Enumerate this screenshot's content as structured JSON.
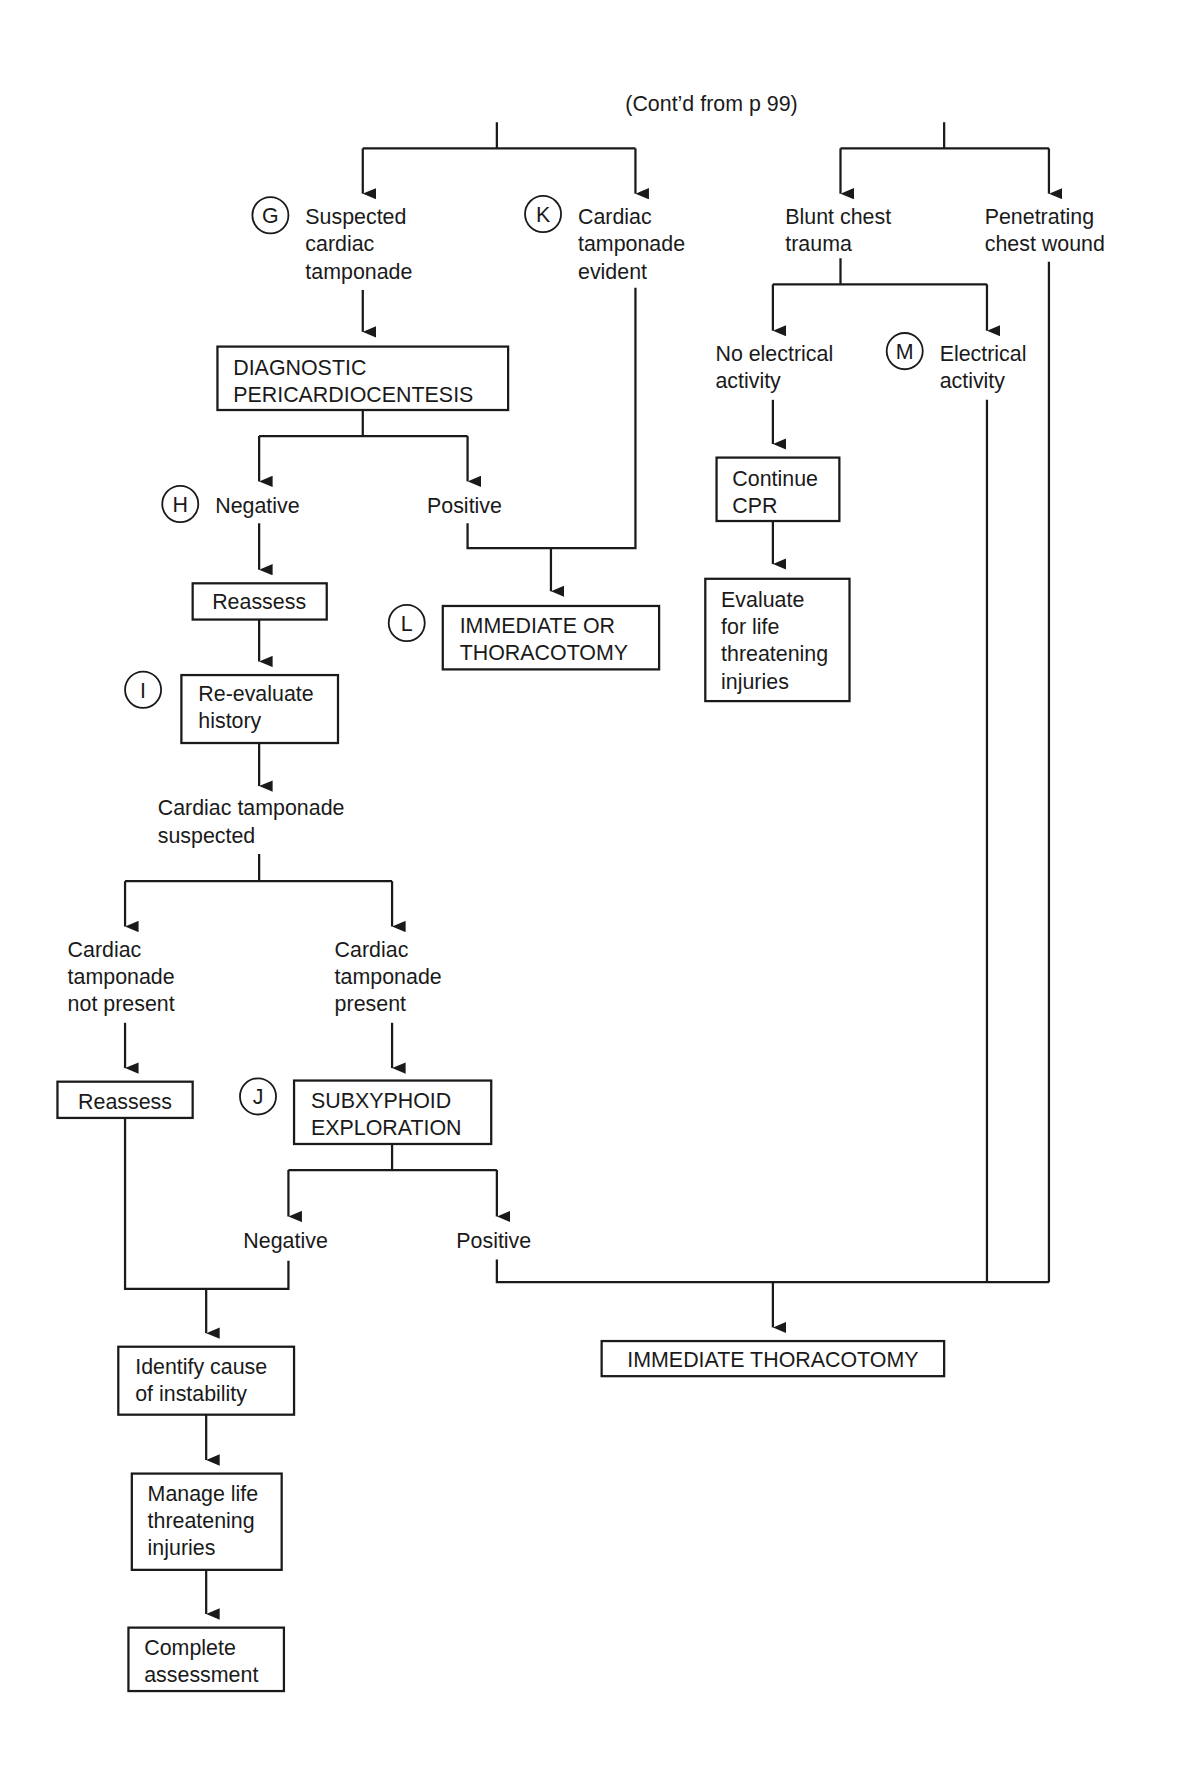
{
  "header": {
    "continuation": "(Cont’d from p 99)"
  },
  "markers": {
    "G": "G",
    "H": "H",
    "I": "I",
    "J": "J",
    "K": "K",
    "L": "L",
    "M": "M"
  },
  "nodes": {
    "suspected_tamponade": [
      "Suspected",
      "cardiac",
      "tamponade"
    ],
    "tamponade_evident": [
      "Cardiac",
      "tamponade",
      "evident"
    ],
    "blunt_trauma": [
      "Blunt chest",
      "trauma"
    ],
    "penetrating_wound": [
      "Penetrating",
      "chest wound"
    ],
    "diag_pericardiocentesis": [
      "DIAGNOSTIC",
      "PERICARDIOCENTESIS"
    ],
    "no_electrical": [
      "No electrical",
      "activity"
    ],
    "electrical": [
      "Electrical",
      "activity"
    ],
    "negative_1": "Negative",
    "positive_1": "Positive",
    "continue_cpr": [
      "Continue",
      "CPR"
    ],
    "reassess_1": "Reassess",
    "immediate_or": [
      "IMMEDIATE OR",
      "THORACOTOMY"
    ],
    "evaluate_life": [
      "Evaluate",
      "for life",
      "threatening",
      "injuries"
    ],
    "reevaluate_history": [
      "Re-evaluate",
      "history"
    ],
    "tamponade_suspected": [
      "Cardiac tamponade",
      "suspected"
    ],
    "tamponade_not_present": [
      "Cardiac",
      "tamponade",
      "not present"
    ],
    "tamponade_present": [
      "Cardiac",
      "tamponade",
      "present"
    ],
    "reassess_2": "Reassess",
    "subxyphoid": [
      "SUBXYPHOID",
      "EXPLORATION"
    ],
    "negative_2": "Negative",
    "positive_2": "Positive",
    "identify_cause": [
      "Identify cause",
      "of instability"
    ],
    "immediate_thoracotomy": "IMMEDIATE THORACOTOMY",
    "manage_life": [
      "Manage life",
      "threatening",
      "injuries"
    ],
    "complete_assessment": [
      "Complete",
      "assessment"
    ]
  }
}
